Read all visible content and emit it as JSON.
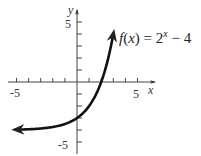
{
  "chart_data": {
    "type": "line",
    "title": "",
    "function_label": "f(x) = 2^x − 4",
    "function_label_parts": {
      "prefix": "f(x) = 2",
      "exponent": "x",
      "suffix": "− 4"
    },
    "xlabel": "x",
    "ylabel": "y",
    "xlim": [
      -6,
      6
    ],
    "ylim": [
      -6,
      6
    ],
    "x_tick_labels": [
      "-5",
      "5"
    ],
    "y_tick_labels": [
      "5",
      "-5"
    ],
    "x_ticks": [
      -5,
      -4,
      -3,
      -2,
      -1,
      1,
      2,
      3,
      4,
      5
    ],
    "y_ticks": [
      -5,
      -4,
      -3,
      -2,
      -1,
      1,
      2,
      3,
      4,
      5
    ],
    "grid": false,
    "series": [
      {
        "name": "f(x) = 2^x - 4",
        "x": [
          -5,
          -4,
          -3,
          -2,
          -1,
          0,
          1,
          2,
          2.5,
          3
        ],
        "y": [
          -3.97,
          -3.94,
          -3.88,
          -3.75,
          -3.5,
          -3,
          -2,
          0,
          1.66,
          4
        ],
        "arrows": "both",
        "color": "#111111"
      }
    ],
    "asymptote": {
      "y": -4,
      "drawn": false
    }
  }
}
